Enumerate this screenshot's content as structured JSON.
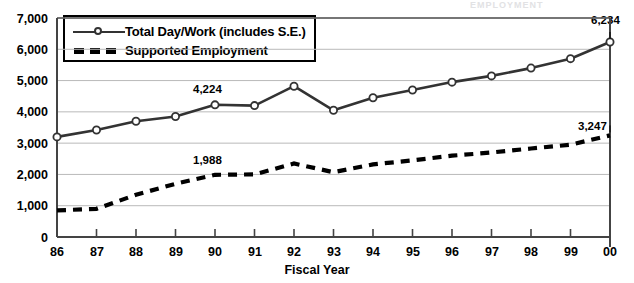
{
  "ghost_title": "EMPLOYMENT",
  "chart_data": {
    "type": "line",
    "title": "",
    "xlabel": "Fiscal Year",
    "ylabel": "",
    "ylim": [
      0,
      7000
    ],
    "ytick_labels": [
      "7,000",
      "6,000",
      "5,000",
      "4,000",
      "3,000",
      "2,000",
      "1,000",
      "0"
    ],
    "yticks": [
      7000,
      6000,
      5000,
      4000,
      3000,
      2000,
      1000,
      0
    ],
    "grid": true,
    "legend_position": "top-left",
    "categories": [
      "86",
      "87",
      "88",
      "89",
      "90",
      "91",
      "92",
      "93",
      "94",
      "95",
      "96",
      "97",
      "98",
      "99",
      "00"
    ],
    "series": [
      {
        "name": "Total Day/Work (includes S.E.)",
        "style": "solid-markers",
        "color": "#333333",
        "values": [
          3200,
          3420,
          3700,
          3850,
          4224,
          4200,
          4820,
          4050,
          4450,
          4700,
          4950,
          5150,
          5400,
          5700,
          6234
        ]
      },
      {
        "name": "Supported Employment",
        "style": "dashed",
        "color": "#000000",
        "values": [
          850,
          900,
          1350,
          1700,
          1988,
          2000,
          2350,
          2070,
          2320,
          2450,
          2600,
          2700,
          2830,
          2950,
          3247
        ]
      }
    ],
    "annotations": [
      {
        "text": "4,224",
        "series": "Total Day/Work (includes S.E.)",
        "category": "90",
        "value": 4224
      },
      {
        "text": "6,234",
        "series": "Total Day/Work (includes S.E.)",
        "category": "00",
        "value": 6234
      },
      {
        "text": "1,988",
        "series": "Supported Employment",
        "category": "90",
        "value": 1988
      },
      {
        "text": "3,247",
        "series": "Supported Employment",
        "category": "00",
        "value": 3247
      }
    ]
  },
  "legend": {
    "items": [
      {
        "label": "Total Day/Work (includes S.E.)"
      },
      {
        "label": "Supported Employment"
      }
    ]
  },
  "axis": {
    "x_title": "Fiscal Year"
  }
}
